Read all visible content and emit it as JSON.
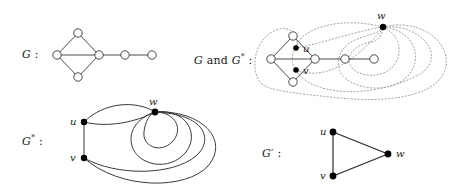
{
  "figure": {
    "caption_panels": 4,
    "stroke_color": "#4a4a4a",
    "dotted_color": "#9a9a9a",
    "solid_color": "#2b2b2b",
    "open_vertex_fill": "#ffffff",
    "filled_vertex_fill": "#000000"
  },
  "panels": {
    "g": {
      "label_main": "G",
      "label_colon": " :",
      "description": "graph G: diamond with chord plus pendant path",
      "vertices": [
        {
          "id": "a",
          "x": 57,
          "y": 55,
          "style": "open"
        },
        {
          "id": "b",
          "x": 78,
          "y": 33,
          "style": "open"
        },
        {
          "id": "c",
          "x": 99,
          "y": 55,
          "style": "open"
        },
        {
          "id": "d",
          "x": 78,
          "y": 77,
          "style": "open"
        },
        {
          "id": "e",
          "x": 125,
          "y": 55,
          "style": "open"
        },
        {
          "id": "f",
          "x": 152,
          "y": 55,
          "style": "open"
        }
      ],
      "edges": [
        [
          "a",
          "b"
        ],
        [
          "b",
          "c"
        ],
        [
          "a",
          "c"
        ],
        [
          "a",
          "d"
        ],
        [
          "d",
          "c"
        ],
        [
          "c",
          "e"
        ],
        [
          "e",
          "f"
        ]
      ]
    },
    "gandgstar": {
      "label_main": "G",
      "label_and": " and ",
      "label_dual": "G",
      "label_star": "*",
      "label_colon": " :",
      "description": "G drawn with its dual G* overlaid using dotted edges",
      "primal_vertices": [
        {
          "id": "a",
          "x": 271,
          "y": 59,
          "style": "open"
        },
        {
          "id": "b",
          "x": 293,
          "y": 36,
          "style": "open"
        },
        {
          "id": "c",
          "x": 315,
          "y": 59,
          "style": "open"
        },
        {
          "id": "d",
          "x": 293,
          "y": 82,
          "style": "open"
        },
        {
          "id": "e",
          "x": 345,
          "y": 59,
          "style": "open"
        },
        {
          "id": "f",
          "x": 374,
          "y": 59,
          "style": "open"
        }
      ],
      "primal_edges": [
        [
          "a",
          "b"
        ],
        [
          "b",
          "c"
        ],
        [
          "a",
          "c"
        ],
        [
          "a",
          "d"
        ],
        [
          "d",
          "c"
        ],
        [
          "c",
          "e"
        ],
        [
          "e",
          "f"
        ]
      ],
      "dual_vertices": [
        {
          "id": "u",
          "label": "u",
          "x": 296,
          "y": 48,
          "style": "filled",
          "label_dx": 6,
          "label_dy": 4
        },
        {
          "id": "v",
          "label": "v",
          "x": 296,
          "y": 70,
          "style": "filled",
          "label_dx": 6,
          "label_dy": 4
        },
        {
          "id": "w",
          "label": "w",
          "x": 383,
          "y": 27,
          "style": "filled",
          "label_dx": -3,
          "label_dy": -8
        }
      ]
    },
    "gstar": {
      "label_main": "G",
      "label_star": "*",
      "label_colon": " :",
      "description": "dual multigraph G* with parallel edges and loops",
      "vertices": [
        {
          "id": "u",
          "label": "u",
          "x": 84,
          "y": 122,
          "style": "filled",
          "label_dx": -12,
          "label_dy": 4
        },
        {
          "id": "v",
          "label": "v",
          "x": 84,
          "y": 158,
          "style": "filled",
          "label_dx": -12,
          "label_dy": 4
        },
        {
          "id": "w",
          "label": "w",
          "x": 155,
          "y": 112,
          "style": "filled",
          "label_dx": -4,
          "label_dy": -8
        }
      ],
      "edge_summary": [
        {
          "between": "u-v",
          "multiplicity": 1
        },
        {
          "between": "u-w",
          "multiplicity": 2
        },
        {
          "between": "v-w",
          "multiplicity": 2
        },
        {
          "between": "w-w",
          "multiplicity": 2,
          "kind": "loop"
        }
      ]
    },
    "gprime": {
      "label_main": "G",
      "label_prime": "′",
      "label_colon": " :",
      "description": "simple graph G' : triangle on u, v, w",
      "vertices": [
        {
          "id": "u",
          "label": "u",
          "x": 333,
          "y": 132,
          "style": "filled",
          "label_dx": -12,
          "label_dy": 4
        },
        {
          "id": "v",
          "label": "v",
          "x": 333,
          "y": 176,
          "style": "filled",
          "label_dx": -12,
          "label_dy": 4
        },
        {
          "id": "w",
          "label": "w",
          "x": 388,
          "y": 154,
          "style": "filled",
          "label_dx": 7,
          "label_dy": 4
        }
      ],
      "edges": [
        [
          "u",
          "v"
        ],
        [
          "u",
          "w"
        ],
        [
          "v",
          "w"
        ]
      ]
    }
  }
}
